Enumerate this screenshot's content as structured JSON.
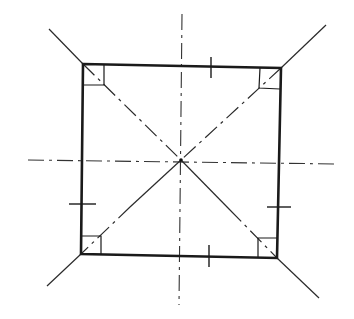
{
  "diagram": {
    "colors": {
      "line": "#1a1a1a",
      "background": "#ffffff"
    },
    "square": {
      "corners": {
        "top_left": [
          83,
          64
        ],
        "top_right": [
          281,
          68
        ],
        "bottom_right": [
          277,
          258
        ],
        "bottom_left": [
          81,
          254
        ]
      }
    },
    "center_point": [
      181,
      160
    ],
    "center_lines": {
      "horizontal": {
        "from": [
          28,
          160
        ],
        "to": [
          338,
          164
        ]
      },
      "vertical": {
        "from": [
          182,
          14
        ],
        "to": [
          179,
          305
        ]
      }
    },
    "diagonals": [
      {
        "name": "tl-br",
        "from": [
          49,
          29
        ],
        "to": [
          319,
          298
        ]
      },
      {
        "name": "tr-bl",
        "from": [
          326,
          25
        ],
        "to": [
          47,
          286
        ]
      }
    ],
    "right_angle_marks": [
      "top_left",
      "top_right",
      "bottom_right",
      "bottom_left"
    ],
    "equal_length_ticks": [
      {
        "side": "top",
        "at": [
          211,
          67
        ]
      },
      {
        "side": "right",
        "at": [
          279,
          207
        ]
      },
      {
        "side": "bottom",
        "at": [
          209,
          256
        ]
      },
      {
        "side": "left",
        "at": [
          82,
          204
        ]
      }
    ]
  }
}
